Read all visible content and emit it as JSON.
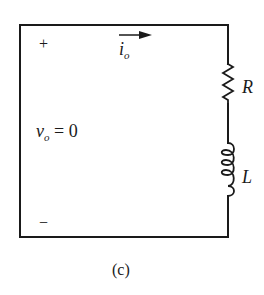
{
  "figure": {
    "caption": "(c)",
    "terminals": {
      "plus": "+",
      "minus": "−"
    },
    "current": {
      "symbol": "i",
      "subscript": "o",
      "direction": "right"
    },
    "voltage": {
      "symbol": "v",
      "subscript": "o",
      "equation_rest": " = 0"
    },
    "components": [
      {
        "type": "resistor",
        "label": "R"
      },
      {
        "type": "inductor",
        "label": "L"
      }
    ],
    "colors": {
      "line": "#1a1a1a",
      "background": "#ffffff"
    }
  }
}
